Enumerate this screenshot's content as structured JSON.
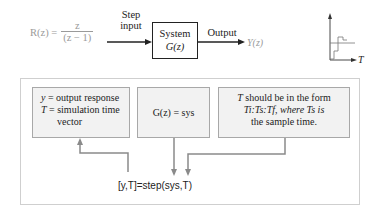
{
  "top_row": {
    "input_formula": {
      "lhs": "R(z) =",
      "numerator": "z",
      "denominator": "(z − 1)"
    },
    "step_input_label": [
      "Step",
      "input"
    ],
    "system_box": {
      "line1": "System",
      "line2": "G(z)"
    },
    "output_label": "Output",
    "output_symbol": "Y(z)",
    "plot_axis_label": "T"
  },
  "panel": {
    "box_outputs": {
      "line1_var": "y",
      "line1_text": " = output response",
      "line2_var": "T",
      "line2_text": " = simulation time",
      "line3_text": "vector"
    },
    "box_system": {
      "text": "G(z) = sys"
    },
    "box_time": {
      "line1_var": "T",
      "line1_text": " should be in the form",
      "line2": "Ti:Ts:Tf, where Ts is",
      "line3": "the sample time."
    },
    "command": "[y,T]=step(sys,T)"
  },
  "colors": {
    "text": "#222222",
    "gray_text": "#9a9a9a",
    "arrow_gray": "#8a8a8a",
    "box_fill": "#f2f2f2",
    "box_border": "#a8a8a8"
  }
}
